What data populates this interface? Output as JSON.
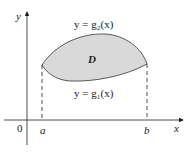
{
  "diagram": {
    "region_label": "D",
    "upper_curve_label": "y = g₂(x)",
    "lower_curve_label": "y = g₁(x)",
    "axis_x_label": "x",
    "axis_y_label": "y",
    "origin_label": "0",
    "left_bound_label": "a",
    "right_bound_label": "b",
    "region_fill": "#d9d9d9",
    "line_color": "#222222"
  }
}
